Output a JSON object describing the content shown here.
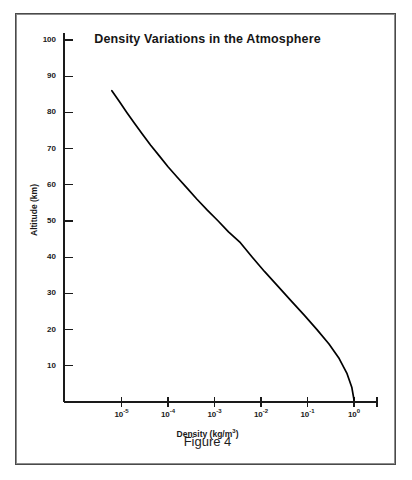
{
  "figure": {
    "caption": "Figure 4"
  },
  "chart_data": {
    "type": "line",
    "title": "Density Variations in the Atmosphere",
    "xlabel": "Density (kg/m",
    "xlabel_sup": "3",
    "xlabel_tail": ")",
    "ylabel": "Altitude (km)",
    "xscale": "log",
    "yscale": "linear",
    "xlim": [
      1e-06,
      3.0
    ],
    "ylim": [
      0,
      105
    ],
    "grid": false,
    "legend": null,
    "x_ticks": [
      {
        "value": 1e-05,
        "label": "10",
        "exp": "-5"
      },
      {
        "value": 0.0001,
        "label": "10",
        "exp": "-4"
      },
      {
        "value": 0.001,
        "label": "10",
        "exp": "-3"
      },
      {
        "value": 0.01,
        "label": "10",
        "exp": "-2"
      },
      {
        "value": 0.1,
        "label": "10",
        "exp": "-1"
      },
      {
        "value": 1.0,
        "label": "10",
        "exp": "0"
      }
    ],
    "y_ticks": [
      {
        "value": 100,
        "label": "100"
      },
      {
        "value": 90,
        "label": "90"
      },
      {
        "value": 80,
        "label": "80"
      },
      {
        "value": 70,
        "label": "70"
      },
      {
        "value": 60,
        "label": "60"
      },
      {
        "value": 50,
        "label": "50"
      },
      {
        "value": 40,
        "label": "40"
      },
      {
        "value": 30,
        "label": "30"
      },
      {
        "value": 20,
        "label": "20"
      },
      {
        "value": 10,
        "label": "10"
      }
    ],
    "series": [
      {
        "name": "Atmospheric density",
        "color": "#000000",
        "x": [
          6.2e-06,
          9e-06,
          1.3e-05,
          1.9e-05,
          2.8e-05,
          4.2e-05,
          6.5e-05,
          0.0001,
          0.00016,
          0.00026,
          0.00042,
          0.0007,
          0.0012,
          0.002,
          0.0036,
          0.0065,
          0.012,
          0.023,
          0.044,
          0.085,
          0.16,
          0.29,
          0.48,
          0.7,
          0.9,
          1.0
        ],
        "y": [
          86.0,
          83.0,
          80.0,
          77.0,
          74.0,
          71.0,
          68.0,
          65.0,
          62.0,
          59.0,
          56.0,
          53.0,
          50.0,
          47.0,
          44.0,
          40.0,
          36.0,
          32.0,
          28.0,
          24.0,
          20.0,
          16.0,
          12.0,
          8.0,
          4.0,
          0.6
        ]
      }
    ]
  }
}
